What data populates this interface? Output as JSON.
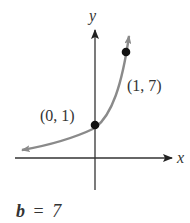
{
  "figure": {
    "axes": {
      "x_label": "x",
      "y_label": "y"
    },
    "function": "y = 7^x",
    "curve_color": "#8a8a8a",
    "axis_color": "#333333",
    "points": [
      {
        "label": "(0, 1)",
        "x": 0,
        "y": 1
      },
      {
        "label": "(1, 7)",
        "x": 1,
        "y": 7
      }
    ],
    "caption": {
      "var": "b",
      "eq": "=",
      "value": "7"
    }
  }
}
